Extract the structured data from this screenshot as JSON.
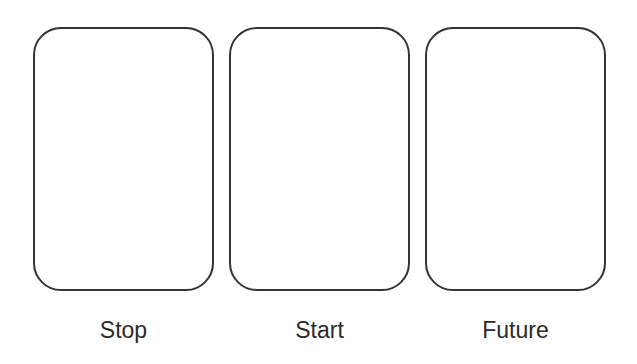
{
  "panels": [
    {
      "label": "Stop"
    },
    {
      "label": "Start"
    },
    {
      "label": "Future"
    }
  ],
  "colors": {
    "stroke": "#333333",
    "text": "#2a2a2a",
    "background": "#ffffff"
  }
}
